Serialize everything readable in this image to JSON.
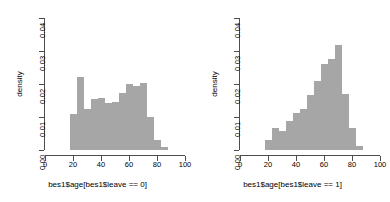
{
  "figure": {
    "panel_count": 2,
    "bar_color": "#a6a6a6",
    "axis_color": "#4d4d4d"
  },
  "panels": [
    {
      "ylabel": "density",
      "xlabel": "bes1$age[bes1$leave == 0]",
      "xticks": [
        "0",
        "20",
        "40",
        "60",
        "80",
        "100"
      ],
      "yticks": [
        "0.00",
        "0.01",
        "0.02",
        "0.03",
        "0.04"
      ]
    },
    {
      "ylabel": "density",
      "xlabel": "bes1$age[bes1$leave == 1]",
      "xticks": [
        "0",
        "20",
        "40",
        "60",
        "80",
        "100"
      ],
      "yticks": [
        "0.00",
        "0.01",
        "0.02",
        "0.03",
        "0.04"
      ]
    }
  ],
  "chart_data": [
    {
      "type": "bar",
      "title": "",
      "xlabel": "bes1$age[bes1$leave == 0]",
      "ylabel": "density",
      "xlim": [
        0,
        100
      ],
      "ylim": [
        0,
        0.04
      ],
      "xticks": [
        0,
        20,
        40,
        60,
        80,
        100
      ],
      "yticks": [
        0.0,
        0.01,
        0.02,
        0.03,
        0.04
      ],
      "grid": false,
      "legend": "none",
      "bin_width": 5,
      "bin_starts": [
        17.5,
        22.5,
        27.5,
        32.5,
        37.5,
        42.5,
        47.5,
        52.5,
        57.5,
        62.5,
        67.5,
        72.5,
        77.5,
        82.5
      ],
      "categories": [
        "17.5-22.5",
        "22.5-27.5",
        "27.5-32.5",
        "32.5-37.5",
        "37.5-42.5",
        "42.5-47.5",
        "47.5-52.5",
        "52.5-57.5",
        "57.5-62.5",
        "62.5-67.5",
        "67.5-72.5",
        "72.5-77.5",
        "77.5-82.5",
        "82.5-87.5"
      ],
      "values": [
        0.011,
        0.022,
        0.0125,
        0.0155,
        0.0158,
        0.0142,
        0.0145,
        0.0172,
        0.0199,
        0.0195,
        0.0202,
        0.01,
        0.003,
        0.001
      ]
    },
    {
      "type": "bar",
      "title": "",
      "xlabel": "bes1$age[bes1$leave == 1]",
      "ylabel": "density",
      "xlim": [
        0,
        100
      ],
      "ylim": [
        0,
        0.04
      ],
      "xticks": [
        0,
        20,
        40,
        60,
        80,
        100
      ],
      "yticks": [
        0.0,
        0.01,
        0.02,
        0.03,
        0.04
      ],
      "grid": false,
      "legend": "none",
      "bin_width": 5,
      "bin_starts": [
        17.5,
        22.5,
        27.5,
        32.5,
        37.5,
        42.5,
        47.5,
        52.5,
        57.5,
        62.5,
        67.5,
        72.5,
        77.5,
        82.5
      ],
      "categories": [
        "17.5-22.5",
        "22.5-27.5",
        "27.5-32.5",
        "32.5-37.5",
        "37.5-42.5",
        "42.5-47.5",
        "47.5-52.5",
        "52.5-57.5",
        "57.5-62.5",
        "62.5-67.5",
        "67.5-72.5",
        "72.5-77.5",
        "77.5-82.5",
        "82.5-87.5"
      ],
      "values": [
        0.003,
        0.0068,
        0.0058,
        0.0087,
        0.0112,
        0.0125,
        0.0168,
        0.021,
        0.026,
        0.0275,
        0.0318,
        0.017,
        0.0067,
        0.0013
      ]
    }
  ]
}
